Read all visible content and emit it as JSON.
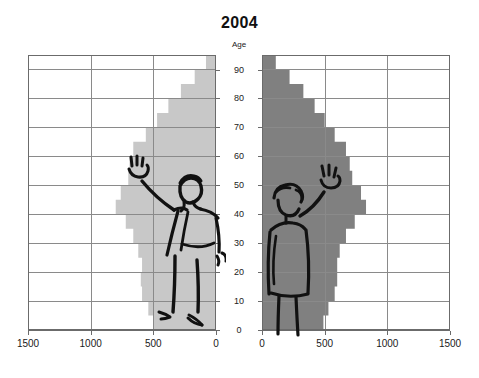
{
  "chart_data": {
    "type": "bar",
    "title": "2004",
    "subtitle": "",
    "xlabel": "",
    "ylabel": "Age",
    "orientation": "horizontal",
    "layout": "population-pyramid",
    "grid": true,
    "legend_position": "none",
    "age_axis": {
      "label": "Age",
      "ticks": [
        "0",
        "10",
        "20",
        "30",
        "40",
        "50",
        "60",
        "70",
        "80",
        "90"
      ],
      "range": [
        0,
        95
      ],
      "tick_interval": 10
    },
    "left_panel": {
      "name": "Males",
      "color": "#c8c8c8",
      "direction": "right-to-left",
      "axis_ticks": [
        "1500",
        "1000",
        "500",
        "0"
      ],
      "axis_range": [
        0,
        1500
      ]
    },
    "right_panel": {
      "name": "Females",
      "color": "#808080",
      "direction": "left-to-right",
      "axis_ticks": [
        "0",
        "500",
        "1000",
        "1500"
      ],
      "axis_range": [
        0,
        1500
      ]
    },
    "categories": [
      0,
      5,
      10,
      15,
      20,
      25,
      30,
      35,
      40,
      45,
      50,
      55,
      60,
      65,
      70,
      75,
      80,
      85,
      90,
      95
    ],
    "series": [
      {
        "name": "Males",
        "color": "#c8c8c8",
        "values": [
          500,
          540,
          590,
          600,
          590,
          620,
          660,
          720,
          800,
          760,
          700,
          690,
          660,
          560,
          470,
          380,
          280,
          170,
          80,
          20
        ]
      },
      {
        "name": "Females",
        "color": "#808080",
        "values": [
          490,
          530,
          580,
          600,
          600,
          620,
          670,
          740,
          830,
          790,
          720,
          700,
          670,
          580,
          500,
          420,
          330,
          220,
          110,
          30
        ]
      }
    ],
    "annotations": [
      {
        "name": "male-figure",
        "description": "hand-drawn waving man overlaid on left pyramid"
      },
      {
        "name": "female-figure",
        "description": "hand-drawn waving woman overlaid on right pyramid"
      }
    ]
  },
  "title": "2004",
  "age_axis_title": "Age",
  "age_labels": [
    "90",
    "80",
    "70",
    "60",
    "50",
    "40",
    "30",
    "20",
    "10",
    "0"
  ],
  "x_labels_left": [
    "1500",
    "1000",
    "500",
    "0"
  ],
  "x_labels_right": [
    "0",
    "500",
    "1000",
    "1500"
  ],
  "colors": {
    "male_fill": "#c8c8c8",
    "female_fill": "#808080",
    "grid": "#8a8a8a",
    "frame": "#6b6b6b",
    "ink": "#111111",
    "background": "#ffffff"
  }
}
